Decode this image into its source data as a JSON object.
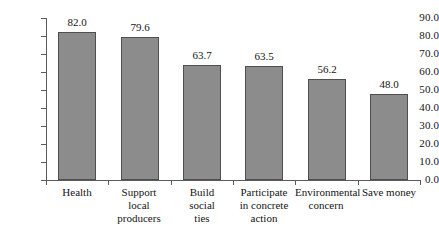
{
  "chart_data": {
    "type": "bar",
    "title": "",
    "subtitle": "",
    "xlabel": "",
    "ylabel": "",
    "categories": [
      "Health",
      "Support local producers",
      "Build social ties",
      "Participate in concrete action",
      "Environmental concern",
      "Save money"
    ],
    "category_lines": [
      [
        "Health"
      ],
      [
        "Support",
        "local",
        "producers"
      ],
      [
        "Build",
        "social",
        "ties"
      ],
      [
        "Participate",
        "in concrete",
        "action"
      ],
      [
        "Environmental",
        "concern"
      ],
      [
        "Save money"
      ]
    ],
    "values": [
      82.0,
      79.6,
      63.7,
      63.5,
      56.2,
      48.0
    ],
    "value_labels": [
      "82.0",
      "79.6",
      "63.7",
      "63.5",
      "56.2",
      "48.0"
    ],
    "ylim": [
      0.0,
      90.0
    ],
    "ytick_step": 10.0,
    "ytick_labels": [
      "90.0",
      "80.0",
      "70.0",
      "60.0",
      "50.0",
      "40.0",
      "30.0",
      "20.0",
      "10.0",
      "0.0"
    ],
    "ytick_values": [
      90.0,
      80.0,
      70.0,
      60.0,
      50.0,
      40.0,
      30.0,
      20.0,
      10.0,
      0.0
    ],
    "grid": false,
    "legend": false,
    "legend_position": "none",
    "bar_fill_color": "#8c8c8c",
    "bar_border_color": "#4f4f4f",
    "axis_color": "#5a5a5a",
    "background_color": "#ffffff",
    "text_color": "#141414"
  }
}
